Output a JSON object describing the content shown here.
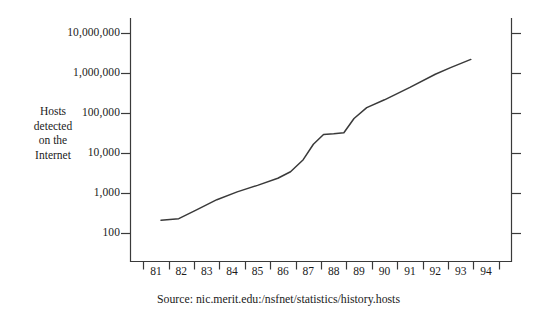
{
  "figure": {
    "background_color": "#ffffff",
    "ink_color": "#3a3a3a",
    "text_color": "#1b1b1b"
  },
  "yaxis_title_lines": [
    "Hosts",
    "detected",
    "on the",
    "Internet"
  ],
  "source_caption": "Source: nic.merit.edu:/nsfnet/statistics/history.hosts",
  "chart_data": {
    "type": "line",
    "title": "",
    "subtitle": "",
    "xlabel": "",
    "ylabel": "Hosts detected on the Internet",
    "yscale": "log",
    "ylim": [
      100,
      10000000
    ],
    "ytick_labels": [
      "10,000,000",
      "1,000,000",
      "100,000",
      "10,000",
      "1,000",
      "100"
    ],
    "ytick_values": [
      10000000,
      1000000,
      100000,
      10000,
      1000,
      100
    ],
    "xlim": [
      80,
      95
    ],
    "xtick_labels": [
      "81",
      "82",
      "83",
      "84",
      "85",
      "86",
      "87",
      "88",
      "89",
      "90",
      "91",
      "92",
      "93",
      "94"
    ],
    "xtick_values": [
      81,
      82,
      83,
      84,
      85,
      86,
      87,
      88,
      89,
      90,
      91,
      92,
      93,
      94
    ],
    "grid": false,
    "legend": null,
    "annotations": [],
    "series": [
      {
        "name": "Hosts detected on the Internet",
        "color": "#3a3a3a",
        "x": [
          81.2,
          81.9,
          82.6,
          83.4,
          84.2,
          85.0,
          85.8,
          86.3,
          86.8,
          87.2,
          87.6,
          88.0,
          88.4,
          88.8,
          89.3,
          90.0,
          91.0,
          92.0,
          92.6,
          93.4
        ],
        "y": [
          215,
          235,
          390,
          700,
          1100,
          1600,
          2400,
          3500,
          7000,
          17000,
          30000,
          31000,
          33000,
          75000,
          140000,
          220000,
          450000,
          960000,
          1400000,
          2250000
        ]
      }
    ]
  }
}
